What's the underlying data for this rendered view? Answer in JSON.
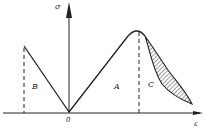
{
  "diagram": {
    "type": "stress-strain curve",
    "axes": {
      "y_label": "σ",
      "x_label": "ε",
      "origin_label": "0"
    },
    "regions": [
      {
        "label": "B",
        "description": "left linear branch"
      },
      {
        "label": "A",
        "description": "rising branch to peak"
      },
      {
        "label": "C",
        "description": "hatched softening region after peak"
      }
    ],
    "colors": {
      "line": "#222222",
      "background": "#ffffff"
    }
  }
}
